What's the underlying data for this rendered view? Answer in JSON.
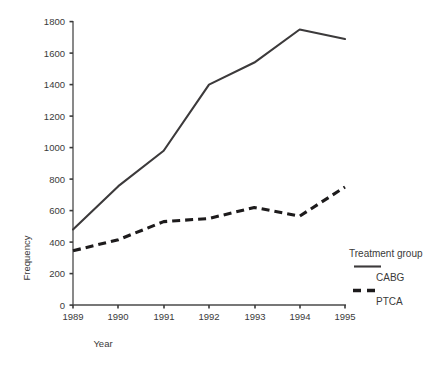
{
  "chart_data": {
    "type": "line",
    "title": "",
    "xlabel": "Year",
    "ylabel": "Frequency",
    "categories": [
      "1989",
      "1990",
      "1991",
      "1992",
      "1993",
      "1994",
      "1995"
    ],
    "x": [
      1989,
      1990,
      1991,
      1992,
      1993,
      1994,
      1995
    ],
    "series": [
      {
        "name": "CABG",
        "style": "solid",
        "color": "#3c3a3b",
        "values": [
          480,
          755,
          980,
          1400,
          1540,
          1750,
          1690
        ]
      },
      {
        "name": "PTCA",
        "style": "dashed",
        "color": "#1d1b1c",
        "values": [
          345,
          415,
          530,
          550,
          620,
          565,
          750
        ]
      }
    ],
    "ylim": [
      0,
      1800
    ],
    "yticks": [
      0,
      200,
      400,
      600,
      800,
      1000,
      1200,
      1400,
      1600,
      1800
    ],
    "ytick_labels": [
      "0",
      "200",
      "400",
      "600",
      "800",
      "1000",
      "1200",
      "1400",
      "1600",
      "1800"
    ],
    "xtick_labels": [
      "1989",
      "1990",
      "1991",
      "1992",
      "1993",
      "1994",
      "1995"
    ],
    "grid": false,
    "legend_position": "right",
    "legend_title": "Treatment group",
    "legend_entries": [
      {
        "label": "CABG",
        "style": "solid"
      },
      {
        "label": "PTCA",
        "style": "dashed"
      }
    ]
  },
  "axes": {
    "y_title": "Frequency",
    "x_title": "Year"
  },
  "legend": {
    "title": "Treatment group",
    "item_1_label": "CABG",
    "item_2_label": "PTCA"
  },
  "ytick": {
    "t0": "0",
    "t1": "200",
    "t2": "400",
    "t3": "600",
    "t4": "800",
    "t5": "1000",
    "t6": "1200",
    "t7": "1400",
    "t8": "1600",
    "t9": "1800"
  },
  "xtick": {
    "t0": "1989",
    "t1": "1990",
    "t2": "1991",
    "t3": "1992",
    "t4": "1993",
    "t5": "1994",
    "t6": "1995"
  }
}
